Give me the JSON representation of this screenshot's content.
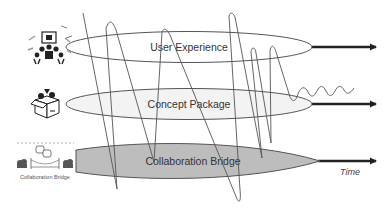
{
  "diagram": {
    "layers": [
      {
        "label": "User Experience",
        "icon": "team-meeting-icon",
        "fill": "#ffffff"
      },
      {
        "label": "Concept Package",
        "icon": "package-box-icon",
        "fill": "#f3f3f3"
      },
      {
        "label": "Collaboration Bridge",
        "icon": "collaboration-bridge-icon",
        "fill": "#bdbdbd",
        "icon_caption": "Collaboration Bridge"
      }
    ],
    "axis_label": "Time",
    "colors": {
      "outline": "#555555",
      "arrow": "#222222",
      "curve": "#555555"
    }
  }
}
